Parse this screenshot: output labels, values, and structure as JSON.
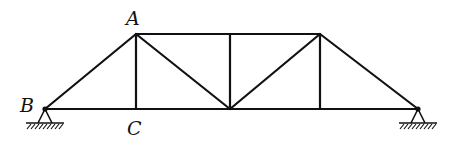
{
  "diagram": {
    "type": "truss",
    "colors": {
      "member": "#111111",
      "background": "#ffffff"
    },
    "labels": {
      "A": "A",
      "B": "B",
      "C": "C"
    },
    "nodes": {
      "B": [
        45,
        109
      ],
      "C": [
        136,
        109
      ],
      "M": [
        230,
        109
      ],
      "D": [
        320,
        109
      ],
      "E": [
        418,
        109
      ],
      "A": [
        136,
        34
      ],
      "T": [
        230,
        34
      ],
      "F": [
        320,
        34
      ]
    },
    "members": [
      [
        "B",
        "A"
      ],
      [
        "A",
        "T"
      ],
      [
        "T",
        "F"
      ],
      [
        "F",
        "E"
      ],
      [
        "B",
        "C"
      ],
      [
        "C",
        "M"
      ],
      [
        "M",
        "D"
      ],
      [
        "D",
        "E"
      ],
      [
        "A",
        "C"
      ],
      [
        "A",
        "M"
      ],
      [
        "T",
        "M"
      ],
      [
        "F",
        "M"
      ],
      [
        "F",
        "D"
      ]
    ],
    "supports": [
      {
        "node": "B",
        "type": "pin"
      },
      {
        "node": "E",
        "type": "pin"
      }
    ]
  }
}
